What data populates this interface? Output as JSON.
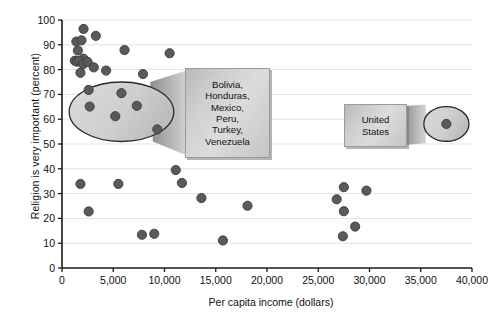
{
  "chart_data": {
    "type": "scatter",
    "title": "",
    "subtitle": "",
    "xlabel": "Per capita income (dollars)",
    "ylabel": "Religion is very important (percent)",
    "xlim": [
      0,
      40000
    ],
    "ylim": [
      0,
      100
    ],
    "xticks": [
      0,
      5000,
      10000,
      15000,
      20000,
      25000,
      30000,
      35000,
      40000
    ],
    "xticklabels": [
      "0",
      "5,000",
      "10,000",
      "15,000",
      "20,000",
      "25,000",
      "30,000",
      "35,000",
      "40,000"
    ],
    "yticks": [
      0,
      10,
      20,
      30,
      40,
      50,
      60,
      70,
      80,
      90,
      100
    ],
    "yticklabels": [
      "0",
      "10",
      "20",
      "30",
      "40",
      "50",
      "60",
      "70",
      "80",
      "90",
      "100"
    ],
    "grid": "horizontal",
    "legend": "none",
    "marker_color": "#5a5a5a",
    "marker_edge_color": "#3c3c3c",
    "marker_size": 6,
    "points": [
      {
        "x": 2100,
        "y": 96.4
      },
      {
        "x": 1400,
        "y": 91.3
      },
      {
        "x": 1900,
        "y": 91.8
      },
      {
        "x": 3300,
        "y": 93.6
      },
      {
        "x": 1550,
        "y": 87.7
      },
      {
        "x": 2100,
        "y": 84.4
      },
      {
        "x": 1250,
        "y": 83.6
      },
      {
        "x": 1450,
        "y": 83.2
      },
      {
        "x": 1700,
        "y": 83.5
      },
      {
        "x": 2050,
        "y": 82.2
      },
      {
        "x": 2500,
        "y": 83.1
      },
      {
        "x": 1800,
        "y": 78.7
      },
      {
        "x": 3100,
        "y": 80.9
      },
      {
        "x": 4300,
        "y": 79.6
      },
      {
        "x": 6100,
        "y": 87.9
      },
      {
        "x": 10500,
        "y": 86.6
      },
      {
        "x": 7900,
        "y": 78.2
      },
      {
        "x": 2600,
        "y": 71.8
      },
      {
        "x": 5800,
        "y": 70.5
      },
      {
        "x": 2700,
        "y": 65.1
      },
      {
        "x": 7300,
        "y": 65.4
      },
      {
        "x": 5200,
        "y": 61.2
      },
      {
        "x": 9300,
        "y": 55.9
      },
      {
        "x": 1800,
        "y": 33.9
      },
      {
        "x": 5500,
        "y": 33.9
      },
      {
        "x": 11100,
        "y": 39.5
      },
      {
        "x": 11700,
        "y": 34.3
      },
      {
        "x": 2600,
        "y": 22.8
      },
      {
        "x": 13600,
        "y": 28.2
      },
      {
        "x": 18100,
        "y": 25.1
      },
      {
        "x": 7800,
        "y": 13.4
      },
      {
        "x": 9000,
        "y": 13.8
      },
      {
        "x": 15700,
        "y": 11.1
      },
      {
        "x": 27500,
        "y": 32.6
      },
      {
        "x": 29700,
        "y": 31.2
      },
      {
        "x": 26800,
        "y": 27.7
      },
      {
        "x": 27500,
        "y": 22.9
      },
      {
        "x": 28600,
        "y": 16.7
      },
      {
        "x": 27400,
        "y": 12.8
      },
      {
        "x": 37500,
        "y": 58.1
      }
    ],
    "highlight_ellipses": [
      {
        "name": "latin-turkey-cluster",
        "cx": 5800,
        "cy": 63.0,
        "rx": 5100,
        "ry": 12.0,
        "label": "Bolivia, Honduras, Mexico, Peru, Turkey, Venezuela"
      },
      {
        "name": "united-states",
        "cx": 37500,
        "cy": 58.1,
        "rx": 2200,
        "ry": 7.0,
        "label": "United States"
      }
    ],
    "annotations": [
      {
        "name": "cluster-callout",
        "lines": [
          "Bolivia,",
          "Honduras,",
          "Mexico,",
          "Peru,",
          "Turkey,",
          "Venezuela"
        ],
        "text": "Bolivia, Honduras, Mexico, Peru, Turkey, Venezuela"
      },
      {
        "name": "united-states-callout",
        "lines": [
          "United",
          "States"
        ],
        "text": "United States"
      }
    ]
  },
  "axes": {
    "x_title": "Per capita income (dollars)",
    "y_title": "Religion is very important (percent)",
    "x_tick_labels": [
      "0",
      "5,000",
      "10,000",
      "15,000",
      "20,000",
      "25,000",
      "30,000",
      "35,000",
      "40,000"
    ],
    "y_tick_labels": [
      "0",
      "10",
      "20",
      "30",
      "40",
      "50",
      "60",
      "70",
      "80",
      "90",
      "100"
    ]
  },
  "callouts": {
    "cluster": {
      "line1": "Bolivia,",
      "line2": "Honduras,",
      "line3": "Mexico,",
      "line4": "Peru,",
      "line5": "Turkey,",
      "line6": "Venezuela"
    },
    "usa": {
      "line1": "United",
      "line2": "States"
    }
  },
  "colors": {
    "marker": "#5a5a5a",
    "marker_edge": "#3c3c3c",
    "gridline": "#e2e2e2",
    "axis": "#1a1a1a",
    "callout_border": "#9a9a9a",
    "ellipse_stroke": "#2a2a2a",
    "ellipse_fill": "#d2d2d2"
  }
}
